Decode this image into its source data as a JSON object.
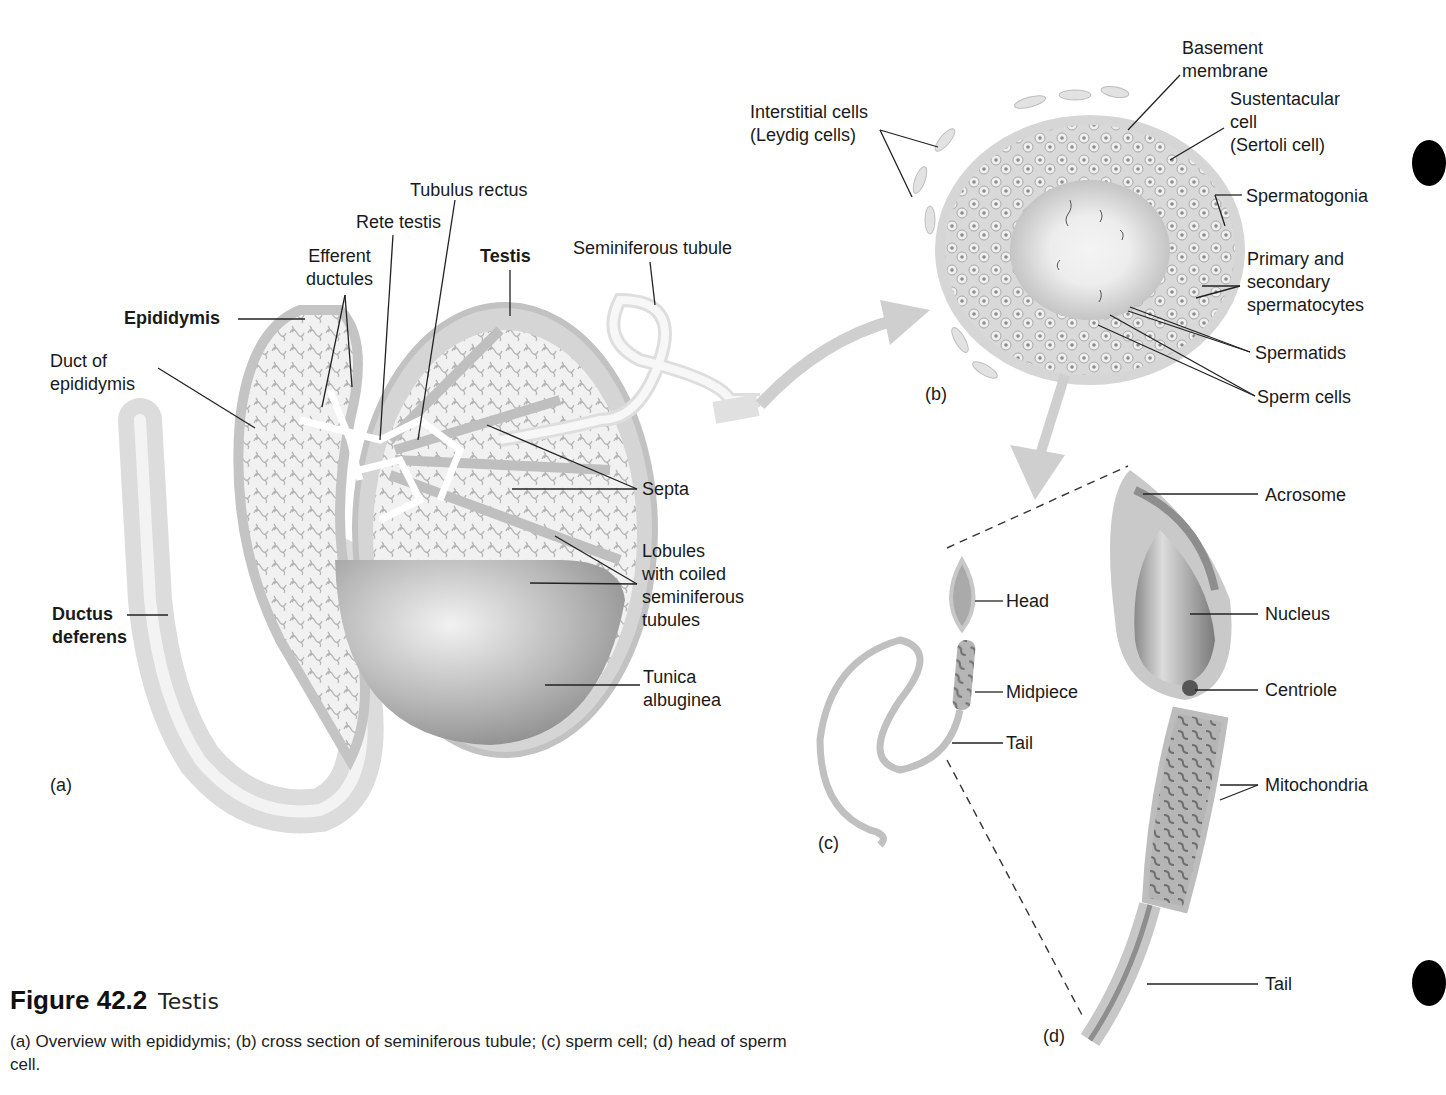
{
  "figure": {
    "number": "Figure 42.2",
    "title": "Testis",
    "caption": "(a) Overview with epididymis; (b) cross section of seminiferous tubule; (c) sperm cell; (d) head of sperm cell."
  },
  "panels": {
    "a": "(a)",
    "b": "(b)",
    "c": "(c)",
    "d": "(d)"
  },
  "panel_a_labels": {
    "tubulus_rectus": "Tubulus rectus",
    "rete_testis": "Rete testis",
    "efferent_ductules": "Efferent\nductules",
    "testis": "Testis",
    "seminiferous_tubule": "Seminiferous tubule",
    "epididymis": "Epididymis",
    "duct_of_epididymis": "Duct of\nepididymis",
    "septa": "Septa",
    "lobules": "Lobules\nwith coiled\nseminiferous\ntubules",
    "ductus_deferens": "Ductus\ndeferens",
    "tunica_albuginea": "Tunica\nalbuginea"
  },
  "panel_b_labels": {
    "interstitial_cells": "Interstitial cells\n(Leydig cells)",
    "basement_membrane": "Basement\nmembrane",
    "sustentacular_cell": "Sustentacular\ncell\n(Sertoli cell)",
    "spermatogonia": "Spermatogonia",
    "spermatocytes": "Primary and\nsecondary\nspermatocytes",
    "spermatids": "Spermatids",
    "sperm_cells": "Sperm cells"
  },
  "panel_c_labels": {
    "head": "Head",
    "midpiece": "Midpiece",
    "tail": "Tail"
  },
  "panel_d_labels": {
    "acrosome": "Acrosome",
    "nucleus": "Nucleus",
    "centriole": "Centriole",
    "mitochondria": "Mitochondria",
    "tail": "Tail"
  },
  "colors": {
    "tissue_light": "#e6e6e6",
    "tissue_mid": "#cfcfcf",
    "tissue_dark": "#9a9a9a",
    "leader_line": "#222222",
    "text": "#1a1a1a"
  }
}
